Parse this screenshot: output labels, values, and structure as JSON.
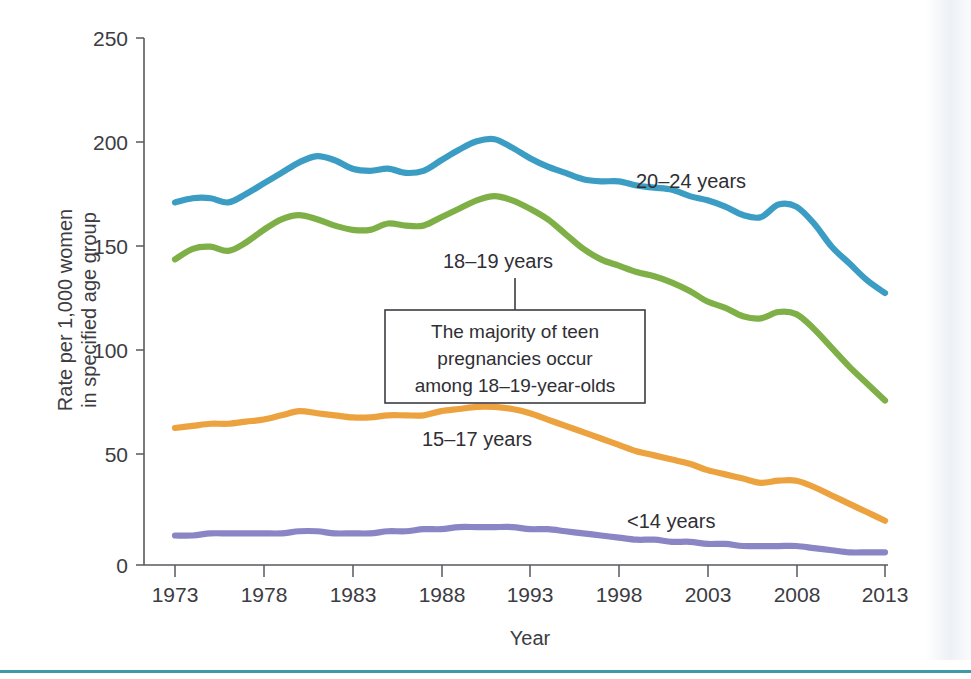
{
  "chart_data": {
    "type": "line",
    "title": "",
    "xlabel": "Year",
    "ylabel": "Rate per 1,000 women in specified age group",
    "ylabel_line1": "Rate per 1,000 women",
    "ylabel_line2": "in specified age group",
    "xlim": [
      1973,
      2013
    ],
    "ylim": [
      0,
      250
    ],
    "xticks": [
      1973,
      1978,
      1983,
      1988,
      1993,
      1998,
      2003,
      2008,
      2013
    ],
    "xtick_labels": [
      "1973",
      "1978",
      "1983",
      "1988",
      "1993",
      "1998",
      "2003",
      "2008",
      "2013"
    ],
    "yticks": [
      0,
      50,
      100,
      150,
      200,
      250
    ],
    "ytick_labels": [
      "0",
      "50",
      "100",
      "150",
      "200",
      "250"
    ],
    "grid": false,
    "legend_position": "inline-labels",
    "x": [
      1973,
      1974,
      1975,
      1976,
      1977,
      1978,
      1979,
      1980,
      1981,
      1982,
      1983,
      1984,
      1985,
      1986,
      1987,
      1988,
      1989,
      1990,
      1991,
      1992,
      1993,
      1994,
      1995,
      1996,
      1997,
      1998,
      1999,
      2000,
      2001,
      2002,
      2003,
      2004,
      2005,
      2006,
      2007,
      2008,
      2009,
      2010,
      2011,
      2012,
      2013
    ],
    "series": [
      {
        "name": "20-24 years",
        "label": "20–24 years",
        "color": "#3b9dc4",
        "values": [
          172,
          174,
          174,
          172,
          176,
          181,
          186,
          191,
          194,
          192,
          188,
          187,
          188,
          186,
          187,
          192,
          197,
          201,
          202,
          198,
          193,
          189,
          186,
          183,
          182,
          182,
          180,
          179,
          178,
          175,
          173,
          170,
          166,
          165,
          171,
          170,
          162,
          151,
          143,
          135,
          129
        ]
      },
      {
        "name": "18-19 years",
        "label": "18–19 years",
        "color": "#7fb047",
        "values": [
          145,
          150,
          151,
          149,
          153,
          159,
          164,
          166,
          164,
          161,
          159,
          159,
          162,
          161,
          161,
          165,
          169,
          173,
          175,
          173,
          169,
          164,
          157,
          150,
          145,
          142,
          139,
          137,
          134,
          130,
          125,
          122,
          118,
          117,
          120,
          119,
          112,
          103,
          94,
          86,
          78
        ]
      },
      {
        "name": "15-17 years",
        "label": "15–17 years",
        "color": "#eca33f",
        "values": [
          65,
          66,
          67,
          67,
          68,
          69,
          71,
          73,
          72,
          71,
          70,
          70,
          71,
          71,
          71,
          73,
          74,
          75,
          75,
          74,
          72,
          69,
          66,
          63,
          60,
          57,
          54,
          52,
          50,
          48,
          45,
          43,
          41,
          39,
          40,
          40,
          37,
          33,
          29,
          25,
          21
        ]
      },
      {
        "name": "<14 years",
        "label": "<14 years",
        "color": "#8a85c4",
        "values": [
          14,
          14,
          15,
          15,
          15,
          15,
          15,
          16,
          16,
          15,
          15,
          15,
          16,
          16,
          17,
          17,
          18,
          18,
          18,
          18,
          17,
          17,
          16,
          15,
          14,
          13,
          12,
          12,
          11,
          11,
          10,
          10,
          9,
          9,
          9,
          9,
          8,
          7,
          6,
          6,
          6
        ]
      }
    ],
    "annotations": [
      {
        "name": "callout-box",
        "lines": [
          "The majority of teen",
          "pregnancies occur",
          "among 18–19-year-olds"
        ],
        "attached_to": "18–19 years"
      }
    ]
  }
}
